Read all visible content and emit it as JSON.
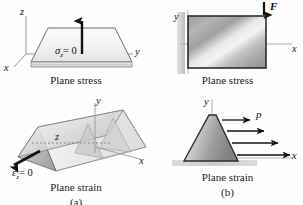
{
  "figure": {
    "background": "#fefefe",
    "width": 303,
    "height": 205
  },
  "panels": {
    "top_left": {
      "name": "plane-stress-3d-plate",
      "caption": "Plane stress",
      "axes": {
        "x": "x",
        "y": "y",
        "z": "z"
      },
      "annotation": {
        "symbol": "σ",
        "subscript": "z",
        "equals": "= 0",
        "full": "σz = 0"
      },
      "arrow": {
        "direction": "up",
        "meaning": "free-surface-normal"
      }
    },
    "top_right": {
      "name": "plane-stress-2d-plate",
      "caption": "Plane stress",
      "axes": {
        "x": "x",
        "y": "y"
      },
      "load": {
        "label": "F",
        "direction": "down"
      },
      "support": "fixed-wall-left"
    },
    "bottom_left": {
      "name": "plane-strain-3d-prism",
      "caption": "Plane strain",
      "sublabel": "(a)",
      "axes": {
        "x": "x",
        "y": "y",
        "z": "z"
      },
      "annotation": {
        "symbol": "ε",
        "subscript": "z",
        "equals": "= 0",
        "full": "εz = 0"
      },
      "arrow": {
        "direction": "down-left",
        "meaning": "axial-constraint"
      }
    },
    "bottom_right": {
      "name": "plane-strain-2d-dam",
      "caption": "Plane strain",
      "sublabel": "(b)",
      "axes": {
        "x": "x",
        "y": "y"
      },
      "load": {
        "label": "p",
        "direction": "left",
        "arrow_count": 4,
        "meaning": "hydrostatic-pressure"
      },
      "support": "ground-base"
    }
  },
  "colors": {
    "ink": "#1a1a1a",
    "outline": "#4a4a4a",
    "fill_light": "#f2f2f2",
    "fill_mid": "#b8b8b8",
    "fill_dark": "#8a8a8a",
    "axis_gray": "#9a9a9a",
    "arrow_black": "#111111"
  }
}
